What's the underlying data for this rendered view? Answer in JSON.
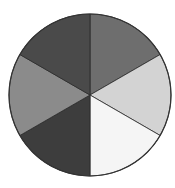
{
  "figure": {
    "type": "divided-circle",
    "center": [
      90,
      95
    ],
    "radius": 81,
    "outline_color": "#333333",
    "divider_color": "#2a2a2a",
    "sectors": [
      {
        "name": "sector-top-right",
        "start_deg": -90,
        "end_deg": -30,
        "color": "#6e6e6e"
      },
      {
        "name": "sector-right",
        "start_deg": -30,
        "end_deg": 30,
        "color": "#d3d3d3"
      },
      {
        "name": "sector-bottom-right",
        "start_deg": 30,
        "end_deg": 90,
        "color": "#f5f5f5"
      },
      {
        "name": "sector-bottom-left",
        "start_deg": 90,
        "end_deg": 150,
        "color": "#3d3d3d"
      },
      {
        "name": "sector-left",
        "start_deg": 150,
        "end_deg": 210,
        "color": "#8b8b8b"
      },
      {
        "name": "sector-top-left",
        "start_deg": 210,
        "end_deg": 270,
        "color": "#4a4a4a"
      }
    ]
  }
}
